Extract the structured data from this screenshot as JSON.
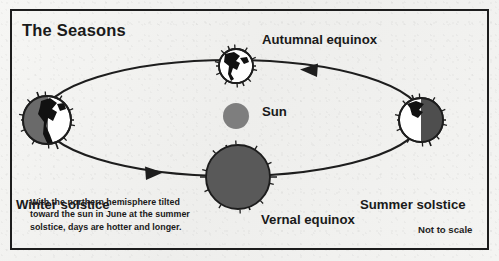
{
  "figure": {
    "title": "The Seasons",
    "note": "Not to scale",
    "caption_lines": [
      "With the northern hemisphere tilted",
      "toward the sun in June at the summer",
      "solstice, days are hotter and longer."
    ]
  },
  "labels": {
    "autumnal_equinox": "Autumnal equinox",
    "vernal_equinox": "Vernal equinox",
    "winter_solstice": "Winter solstice",
    "summer_solstice": "Summer solstice",
    "sun": "Sun"
  },
  "colors": {
    "ink": "#1d1d1d",
    "paper": "#f3f3f1",
    "sun_fill": "#7e7e7e",
    "earth_shadow": "#6a6a6a",
    "earth_lit": "#ffffff",
    "continent": "#111111",
    "orbit_line": "#1d1d1d"
  },
  "diagram": {
    "orbit": {
      "center_x": 232,
      "center_y": 118,
      "radius_x": 190,
      "radius_y": 58,
      "direction": "counterclockwise"
    },
    "sun": {
      "x": 236,
      "y": 116,
      "radius": 13
    },
    "arrows": [
      {
        "name": "top-orbit-arrow",
        "x": 313,
        "y": 70,
        "points": "left"
      },
      {
        "name": "bottom-orbit-arrow",
        "x": 150,
        "y": 173,
        "points": "right"
      }
    ],
    "earths": [
      {
        "name": "earth-autumnal-equinox",
        "x": 236,
        "y": 66,
        "radius": 17,
        "lit_side": "full",
        "axis_tilt_deg": -23.5,
        "label": "Autumnal equinox"
      },
      {
        "name": "earth-winter-solstice",
        "x": 47,
        "y": 120,
        "radius": 24,
        "lit_side": "right",
        "axis_tilt_deg": -23.5,
        "label": "Winter solstice"
      },
      {
        "name": "earth-summer-solstice",
        "x": 421,
        "y": 120,
        "radius": 22,
        "lit_side": "left",
        "axis_tilt_deg": -23.5,
        "label": "Summer solstice"
      },
      {
        "name": "earth-vernal-equinox",
        "x": 238,
        "y": 177,
        "radius": 32,
        "lit_side": "none",
        "axis_tilt_deg": -23.5,
        "label": "Vernal equinox"
      }
    ]
  }
}
